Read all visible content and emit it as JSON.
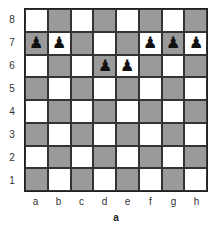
{
  "diagram": {
    "caption": "a",
    "files": [
      "a",
      "b",
      "c",
      "d",
      "e",
      "f",
      "g",
      "h"
    ],
    "ranks": [
      "8",
      "7",
      "6",
      "5",
      "4",
      "3",
      "2",
      "1"
    ],
    "colors": {
      "light": "#ffffff",
      "dark": "#9a9a9a",
      "border": "#222222"
    },
    "pieces": [
      {
        "square": "a7",
        "piece": "black-pawn",
        "glyph": "♟"
      },
      {
        "square": "b7",
        "piece": "black-pawn",
        "glyph": "♟"
      },
      {
        "square": "f7",
        "piece": "black-pawn",
        "glyph": "♟"
      },
      {
        "square": "g7",
        "piece": "black-pawn",
        "glyph": "♟"
      },
      {
        "square": "h7",
        "piece": "black-pawn",
        "glyph": "♟"
      },
      {
        "square": "d6",
        "piece": "black-pawn",
        "glyph": "♟"
      },
      {
        "square": "e6",
        "piece": "black-pawn",
        "glyph": "♟"
      }
    ]
  }
}
